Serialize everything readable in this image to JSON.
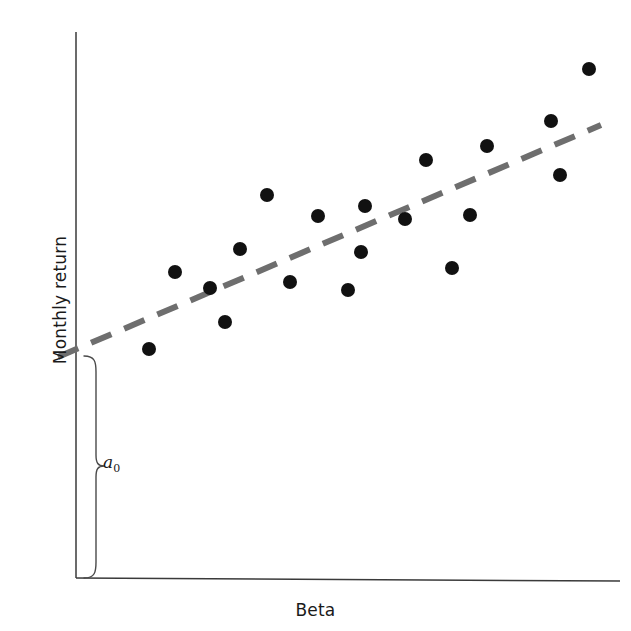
{
  "figure": {
    "background_color": "#ffffff",
    "axis_color": "#3a3a3a",
    "point_color": "#111111",
    "trendline_color": "#6e6e6e"
  },
  "axes": {
    "x_label": "Beta",
    "y_label": "Monthly return",
    "x_axis": {
      "x1": 76,
      "y1": 578,
      "x2": 620,
      "y2": 581
    },
    "y_axis": {
      "x1": 76,
      "y1": 32,
      "x2": 76,
      "y2": 578
    }
  },
  "annotation": {
    "intercept_label": "a",
    "intercept_subscript": "0",
    "brace": {
      "top": 356,
      "bottom": 578,
      "x": 82,
      "width": 22,
      "pointer_y": 466
    }
  },
  "chart_data": {
    "type": "scatter",
    "title": "",
    "xlabel": "Beta",
    "ylabel": "Monthly return",
    "grid": false,
    "legend": false,
    "axis_ticks": [],
    "x_axis_direction": "increasing beta (unlabeled)",
    "y_axis_direction": "increasing monthly return (unlabeled)",
    "points_px": [
      [
        149,
        349
      ],
      [
        175,
        272
      ],
      [
        210,
        288
      ],
      [
        225,
        322
      ],
      [
        240,
        249
      ],
      [
        267,
        195
      ],
      [
        290,
        282
      ],
      [
        318,
        216
      ],
      [
        348,
        290
      ],
      [
        361,
        252
      ],
      [
        365,
        206
      ],
      [
        405,
        219
      ],
      [
        426,
        160
      ],
      [
        452,
        268
      ],
      [
        470,
        215
      ],
      [
        487,
        146
      ],
      [
        551,
        121
      ],
      [
        560,
        175
      ],
      [
        589,
        69
      ]
    ],
    "points": [
      {
        "beta": 0.13,
        "return": 0.42
      },
      {
        "beta": 0.18,
        "return": 0.56
      },
      {
        "beta": 0.25,
        "return": 0.53
      },
      {
        "beta": 0.27,
        "return": 0.47
      },
      {
        "beta": 0.3,
        "return": 0.6
      },
      {
        "beta": 0.35,
        "return": 0.7
      },
      {
        "beta": 0.39,
        "return": 0.54
      },
      {
        "beta": 0.44,
        "return": 0.66
      },
      {
        "beta": 0.5,
        "return": 0.53
      },
      {
        "beta": 0.52,
        "return": 0.6
      },
      {
        "beta": 0.53,
        "return": 0.68
      },
      {
        "beta": 0.6,
        "return": 0.66
      },
      {
        "beta": 0.64,
        "return": 0.77
      },
      {
        "beta": 0.69,
        "return": 0.57
      },
      {
        "beta": 0.72,
        "return": 0.66
      },
      {
        "beta": 0.76,
        "return": 0.79
      },
      {
        "beta": 0.87,
        "return": 0.84
      },
      {
        "beta": 0.89,
        "return": 0.74
      },
      {
        "beta": 0.94,
        "return": 0.93
      }
    ],
    "trendline": {
      "style": "dashed",
      "start_px": [
        58,
        357
      ],
      "end_px": [
        601,
        125
      ],
      "intercept_marker": "a0"
    },
    "point_radius_px": 7
  }
}
